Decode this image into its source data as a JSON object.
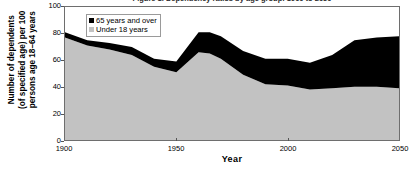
{
  "chart_data": {
    "type": "area",
    "stacked": true,
    "title": "Figure 1. Dependency ratios by age group: 1900 to 2050",
    "xlabel": "Year",
    "ylabel": "Number of dependents\n(of specified age) per 100\npersons age 18–64 years",
    "xlim": [
      1900,
      2050
    ],
    "ylim": [
      0,
      100
    ],
    "xticks": [
      1900,
      1950,
      2000,
      2050
    ],
    "xticklabels": [
      "1900",
      "1950",
      "2000",
      "2050"
    ],
    "yticks": [
      0,
      20,
      40,
      60,
      80,
      100
    ],
    "yticklabels": [
      "0",
      "20",
      "40",
      "60",
      "80",
      "100"
    ],
    "grid": false,
    "legend_position": "upper-left-inside",
    "x": [
      1900,
      1910,
      1920,
      1930,
      1940,
      1950,
      1960,
      1965,
      1970,
      1980,
      1990,
      2000,
      2010,
      2020,
      2030,
      2040,
      2050
    ],
    "series": [
      {
        "name": "Under 18 years",
        "color": "#c2c2c2",
        "values": [
          77,
          71,
          68,
          64,
          55,
          51,
          66,
          65,
          61,
          49,
          42,
          41,
          38,
          39,
          40,
          40,
          39
        ]
      },
      {
        "name": "65 years and over",
        "color": "#000000",
        "values": [
          4,
          4,
          5,
          6,
          6,
          8,
          15,
          16,
          17,
          18,
          19,
          20,
          20,
          25,
          35,
          37,
          39
        ]
      }
    ],
    "totals": [
      81,
      75,
      73,
      70,
      61,
      59,
      81,
      81,
      78,
      67,
      61,
      61,
      58,
      64,
      75,
      77,
      78
    ],
    "annotations": []
  },
  "legend": {
    "items": [
      {
        "label": "65 years and over",
        "color": "#000000"
      },
      {
        "label": "Under 18 years",
        "color": "#c2c2c2"
      }
    ]
  }
}
